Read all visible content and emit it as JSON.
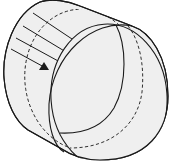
{
  "diagram": {
    "colors": {
      "fill": "#efefef",
      "stroke": "#1a1a1a",
      "background": "#ffffff"
    },
    "elements": [
      {
        "name": "cylinder-body",
        "type": "shaded-solid"
      },
      {
        "name": "front-face-ellipse",
        "type": "solid-ellipse"
      },
      {
        "name": "mid-cross-section-ellipse",
        "type": "dashed-ellipse"
      },
      {
        "name": "inner-arc",
        "type": "solid-arc"
      },
      {
        "name": "parallel-rays",
        "type": "lines",
        "count": 4
      },
      {
        "name": "ray-arrow",
        "type": "arrowhead"
      }
    ]
  }
}
